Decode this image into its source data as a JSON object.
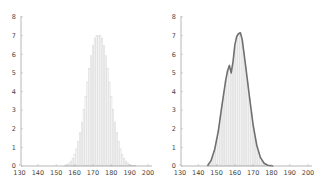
{
  "chart_data": [
    {
      "type": "bar",
      "title": "",
      "xlabel": "",
      "ylabel": "",
      "xlim": [
        130,
        200
      ],
      "ylim": [
        0,
        8
      ],
      "xticks": [
        130,
        140,
        150,
        160,
        170,
        180,
        190,
        200
      ],
      "yticks": [
        0,
        1,
        2,
        3,
        4,
        5,
        6,
        7,
        8
      ],
      "grid": false,
      "legend": null,
      "bar_color": "#d9d9d9",
      "x": [
        155,
        156,
        157,
        158,
        159,
        160,
        161,
        162,
        163,
        164,
        165,
        166,
        167,
        168,
        169,
        170,
        171,
        172,
        173,
        174,
        175,
        176,
        177,
        178,
        179,
        180,
        181,
        182,
        183,
        184,
        185,
        186,
        187,
        188,
        189,
        190,
        191,
        192,
        193
      ],
      "values": [
        0.05,
        0.09,
        0.16,
        0.26,
        0.41,
        0.62,
        0.92,
        1.31,
        1.79,
        2.37,
        3.03,
        3.75,
        4.5,
        5.24,
        5.92,
        6.48,
        6.87,
        7.0,
        6.98,
        7.0,
        6.87,
        6.48,
        5.92,
        5.24,
        4.5,
        3.75,
        3.03,
        2.37,
        1.79,
        1.31,
        0.92,
        0.62,
        0.41,
        0.26,
        0.16,
        0.09,
        0.05,
        0.03,
        0.02
      ]
    },
    {
      "type": "bar",
      "title": "",
      "xlabel": "",
      "ylabel": "",
      "xlim": [
        130,
        200
      ],
      "ylim": [
        0,
        8
      ],
      "xticks": [
        130,
        140,
        150,
        160,
        170,
        180,
        190,
        200
      ],
      "yticks": [
        0,
        1,
        2,
        3,
        4,
        5,
        6,
        7,
        8
      ],
      "grid": false,
      "legend": null,
      "bar_color": "#d9d9d9",
      "curve_color": "#707070",
      "x": [
        146,
        147,
        148,
        149,
        150,
        151,
        152,
        153,
        154,
        155,
        156,
        157,
        158,
        159,
        160,
        161,
        162,
        163,
        164,
        165,
        166,
        167,
        168,
        169,
        170,
        171,
        172,
        173,
        174,
        175,
        176,
        177,
        178,
        179,
        180
      ],
      "values": [
        0.1,
        0.25,
        0.5,
        0.85,
        1.3,
        1.9,
        2.6,
        3.3,
        4.0,
        4.6,
        5.1,
        5.35,
        5.0,
        5.6,
        6.4,
        6.9,
        7.1,
        7.15,
        6.8,
        6.1,
        5.3,
        4.5,
        3.7,
        2.9,
        2.2,
        1.6,
        1.1,
        0.7,
        0.45,
        0.27,
        0.15,
        0.08,
        0.04,
        0.02,
        0.01
      ],
      "curve": {
        "x": [
          145,
          147,
          149,
          151,
          153,
          155,
          156,
          157,
          158,
          159,
          160,
          161,
          162,
          163,
          164,
          166,
          168,
          170,
          172,
          174,
          176,
          178,
          180,
          181
        ],
        "y": [
          0,
          0.3,
          0.9,
          1.9,
          3.3,
          4.6,
          5.1,
          5.4,
          5.0,
          5.6,
          6.5,
          6.95,
          7.1,
          7.15,
          6.8,
          5.3,
          3.7,
          2.2,
          1.1,
          0.45,
          0.15,
          0.04,
          0.01,
          0
        ]
      }
    }
  ]
}
